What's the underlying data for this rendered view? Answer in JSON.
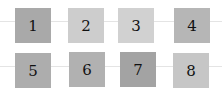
{
  "rows": [
    {
      "tiles": [
        {
          "label": "1",
          "color": "#a9a9a9",
          "x": 15,
          "y": 8
        },
        {
          "label": "2",
          "color": "#cdcdcd",
          "x": 68,
          "y": 8
        },
        {
          "label": "3",
          "color": "#d1d1d1",
          "x": 118,
          "y": 8
        },
        {
          "label": "4",
          "color": "#b6b6b6",
          "x": 174,
          "y": 8
        }
      ]
    },
    {
      "tiles": [
        {
          "label": "5",
          "color": "#adadad",
          "x": 15,
          "y": 53
        },
        {
          "label": "6",
          "color": "#b1b1b1",
          "x": 69,
          "y": 52
        },
        {
          "label": "7",
          "color": "#a3a3a3",
          "x": 120,
          "y": 52
        },
        {
          "label": "8",
          "color": "#c6c6c6",
          "x": 173,
          "y": 53
        }
      ]
    }
  ],
  "rules_y": [
    21,
    66
  ]
}
